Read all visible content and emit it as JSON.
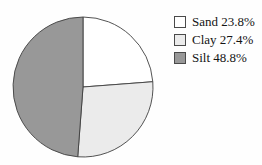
{
  "chart_data": {
    "type": "pie",
    "title": "",
    "direction": "clockwise",
    "start_angle_deg": 0,
    "legend_position": "right",
    "stroke_color": "#3f3f3f",
    "slices": [
      {
        "label": "Sand",
        "value": 23.8,
        "legend_label": "Sand 23.8%",
        "color": "#ffffff"
      },
      {
        "label": "Clay",
        "value": 27.4,
        "legend_label": "Clay 27.4%",
        "color": "#ebebeb"
      },
      {
        "label": "Silt",
        "value": 48.8,
        "legend_label": "Silt 48.8%",
        "color": "#989898"
      }
    ]
  }
}
